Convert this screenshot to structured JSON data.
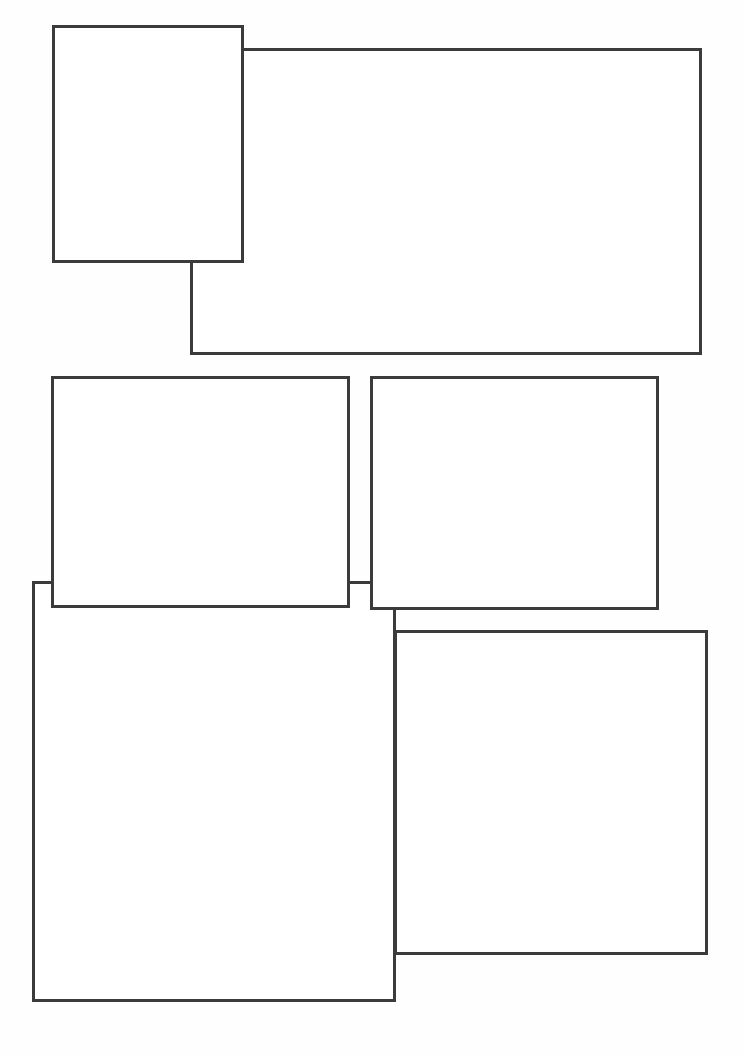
{
  "page": {
    "type": "comic-page-layout",
    "background_color": "#ffffff",
    "border_color": "#3b3b3b",
    "panel_count": 6
  },
  "panels": [
    {
      "id": "top-right-wide",
      "label": "",
      "x": 190,
      "y": 48,
      "width": 512,
      "height": 307,
      "z": 1
    },
    {
      "id": "top-left-tall",
      "label": "",
      "x": 52,
      "y": 25,
      "width": 192,
      "height": 238,
      "z": 2
    },
    {
      "id": "bottom-left-tall",
      "label": "",
      "x": 32,
      "y": 581,
      "width": 364,
      "height": 421,
      "z": 1
    },
    {
      "id": "bottom-right",
      "label": "",
      "x": 394,
      "y": 630,
      "width": 314,
      "height": 325,
      "z": 1
    },
    {
      "id": "middle-left",
      "label": "",
      "x": 51,
      "y": 376,
      "width": 299,
      "height": 232,
      "z": 2
    },
    {
      "id": "middle-right",
      "label": "",
      "x": 370,
      "y": 376,
      "width": 289,
      "height": 234,
      "z": 2
    }
  ]
}
